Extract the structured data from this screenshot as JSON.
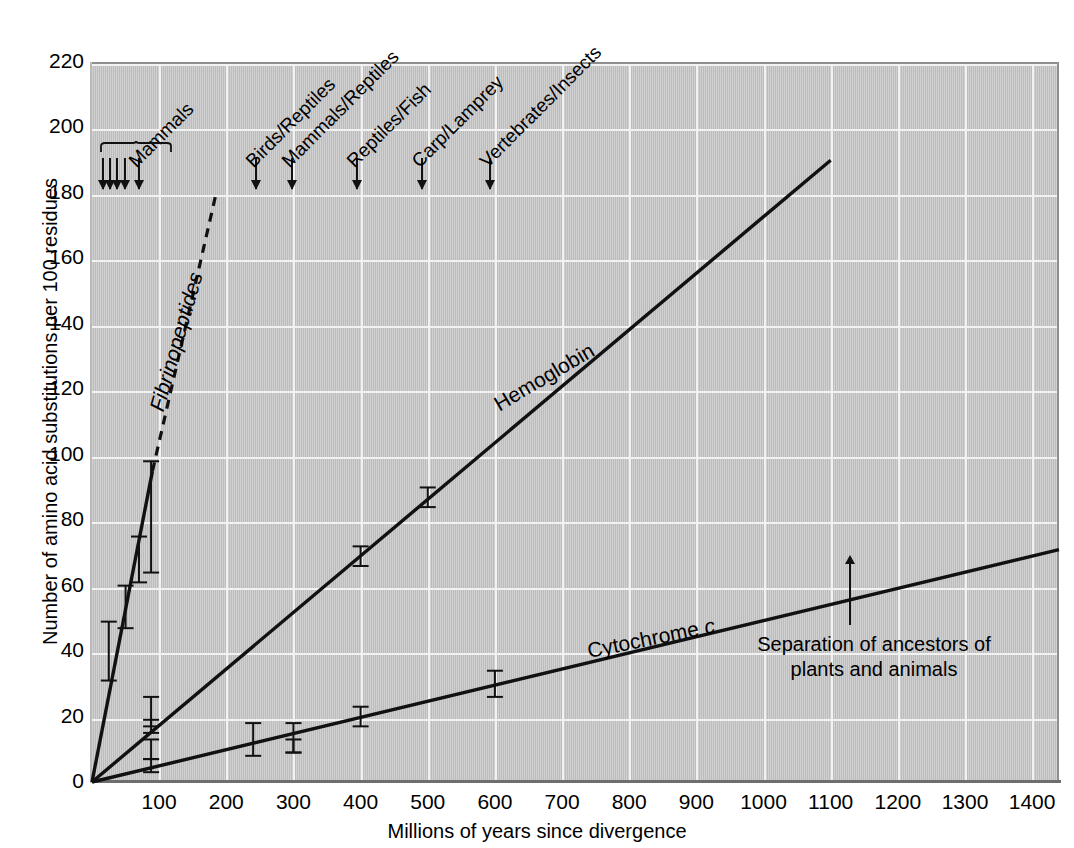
{
  "chart_data": {
    "type": "line",
    "title": "",
    "xlabel": "Millions of years since divergence",
    "ylabel": "Number of amino acid substitutions per 100 residues",
    "xlim": [
      0,
      1440
    ],
    "ylim": [
      0,
      220
    ],
    "xticks": [
      100,
      200,
      300,
      400,
      500,
      600,
      700,
      800,
      900,
      1000,
      1100,
      1200,
      1300,
      1400
    ],
    "yticks": [
      0,
      20,
      40,
      60,
      80,
      100,
      120,
      140,
      160,
      180,
      200,
      220
    ],
    "grid": true,
    "legend_position": "inline-curve-labels",
    "background_color": "#c6c6c6",
    "gridline_color": "#f2f2f2",
    "line_color": "#111111",
    "series": [
      {
        "name": "Fibrinopeptides",
        "style": "solid-then-dashed",
        "slope_per_myr": 1.06,
        "solid_segment": {
          "x": [
            0,
            90
          ],
          "y": [
            0,
            95
          ]
        },
        "dashed_segment": {
          "x": [
            90,
            185
          ],
          "y": [
            95,
            180
          ]
        },
        "points": [
          {
            "x": 25,
            "y": 40,
            "err_low": 31,
            "err_high": 49
          },
          {
            "x": 50,
            "y": 51,
            "err_low": 47,
            "err_high": 60
          },
          {
            "x": 70,
            "y": 67,
            "err_low": 61,
            "err_high": 75
          },
          {
            "x": 88,
            "y": 88,
            "err_low": 64,
            "err_high": 98
          }
        ]
      },
      {
        "name": "Hemoglobin",
        "style": "solid",
        "slope_per_myr": 0.173,
        "solid_segment": {
          "x": [
            0,
            1100
          ],
          "y": [
            0,
            190
          ]
        },
        "points": [
          {
            "x": 88,
            "y": 21,
            "err_low": 17,
            "err_high": 26
          },
          {
            "x": 88,
            "y": 17,
            "err_low": 15,
            "err_high": 19
          },
          {
            "x": 400,
            "y": 69,
            "err_low": 66,
            "err_high": 72
          },
          {
            "x": 500,
            "y": 88,
            "err_low": 84,
            "err_high": 90
          }
        ]
      },
      {
        "name": "Cytochrome c",
        "style": "solid",
        "slope_per_myr": 0.0494,
        "solid_segment": {
          "x": [
            0,
            1440
          ],
          "y": [
            0,
            71
          ]
        },
        "points": [
          {
            "x": 88,
            "y": 10,
            "err_low": 7,
            "err_high": 13
          },
          {
            "x": 88,
            "y": 5,
            "err_low": 3,
            "err_high": 7
          },
          {
            "x": 240,
            "y": 13,
            "err_low": 8,
            "err_high": 18
          },
          {
            "x": 300,
            "y": 13,
            "err_low": 9,
            "err_high": 18
          },
          {
            "x": 300,
            "y": 11,
            "err_low": 9,
            "err_high": 13
          },
          {
            "x": 400,
            "y": 20,
            "err_low": 17,
            "err_high": 23
          },
          {
            "x": 600,
            "y": 30,
            "err_low": 26,
            "err_high": 34
          }
        ]
      }
    ],
    "divergence_markers": [
      {
        "label": "Mammals",
        "x_group": [
          15,
          25,
          35,
          48,
          68
        ],
        "braced": true
      },
      {
        "label": "Birds/Reptiles",
        "x": 243
      },
      {
        "label": "Mammals/Reptiles",
        "x": 297
      },
      {
        "label": "Reptiles/Fish",
        "x": 393
      },
      {
        "label": "Carp/Lamprey",
        "x": 490
      },
      {
        "label": "Vertebrates/Insects",
        "x": 591
      }
    ],
    "annotations": [
      {
        "text": "Separation of ancestors of plants and animals",
        "x": 1200,
        "y": 59
      }
    ],
    "curve_labels": [
      {
        "text": "Fibrinopeptides",
        "italic": true
      },
      {
        "text": "Hemoglobin",
        "italic": false
      },
      {
        "text": "Cytochrome ",
        "italic_suffix": "c"
      }
    ]
  },
  "axes": {
    "xlabel": "Millions of years since divergence",
    "ylabel": "Number of amino acid substitutions per 100 residues",
    "xticks": [
      "100",
      "200",
      "300",
      "400",
      "500",
      "600",
      "700",
      "800",
      "900",
      "1000",
      "1100",
      "1200",
      "1300",
      "1400"
    ],
    "yticks": [
      "220",
      "200",
      "180",
      "160",
      "140",
      "120",
      "100",
      "80",
      "60",
      "40",
      "20",
      "0"
    ]
  },
  "labels": {
    "mammals": "Mammals",
    "birds_reptiles": "Birds/Reptiles",
    "mammals_reptiles": "Mammals/Reptiles",
    "reptiles_fish": "Reptiles/Fish",
    "carp_lamprey": "Carp/Lamprey",
    "vertebrates_insects": "Vertebrates/Insects",
    "fibrinopeptides": "Fibrinopeptides",
    "hemoglobin": "Hemoglobin",
    "cytochrome": "Cytochrome ",
    "cytochrome_italic": "c",
    "annotation_line1": "Separation of ancestors of",
    "annotation_line2": "plants and animals"
  }
}
